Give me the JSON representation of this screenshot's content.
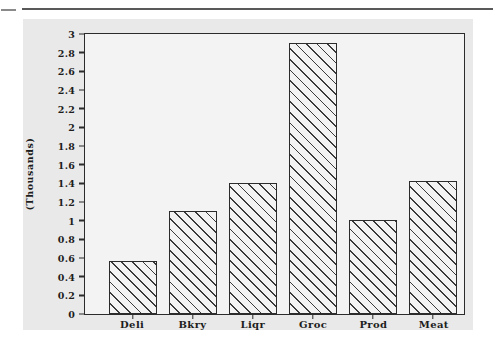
{
  "artifacts": {
    "top_rule": "horizontal-rule",
    "top_dash": "short-dash"
  },
  "chart_data": {
    "type": "bar",
    "title": "",
    "subtitle": "",
    "xlabel": "",
    "ylabel": "(Thousands)",
    "categories": [
      "Deli",
      "Bkry",
      "Liqr",
      "Groc",
      "Prod",
      "Meat"
    ],
    "values": [
      0.57,
      1.1,
      1.4,
      2.9,
      1.01,
      1.42
    ],
    "series": [
      {
        "name": "",
        "values": [
          0.57,
          1.1,
          1.4,
          2.9,
          1.01,
          1.42
        ]
      }
    ],
    "ylim": [
      0,
      3
    ],
    "ytick_labels": [
      "0",
      "0.2",
      "0.4",
      "0.6",
      "0.8",
      "1",
      "1.2",
      "1.4",
      "1.6",
      "1.8",
      "2",
      "2.2",
      "2.4",
      "2.6",
      "2.8",
      "3"
    ],
    "ytick_values": [
      0,
      0.2,
      0.4,
      0.6,
      0.8,
      1,
      1.2,
      1.4,
      1.6,
      1.8,
      2,
      2.2,
      2.4,
      2.6,
      2.8,
      3
    ],
    "grid": false,
    "legend": false,
    "legend_position": "none",
    "bar_fill": "diagonal-hatch",
    "colors": {
      "panel_background": "#e9e9e9",
      "plot_background": "#f3f3f3",
      "axis": "#2b2b2b",
      "hatch": "#3a3a3a",
      "text": "#1d1d1d"
    }
  }
}
